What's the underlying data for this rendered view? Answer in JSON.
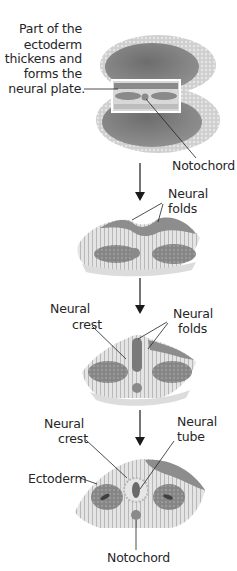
{
  "diagram": {
    "stages": [
      {
        "id": "embryo",
        "labels": {
          "neural_plate_line1": "Part of the",
          "neural_plate_line2": "ectoderm",
          "neural_plate_line3": "thickens and",
          "neural_plate_line4": "forms the",
          "neural_plate_line5": "neural plate.",
          "notochord": "Notochord"
        }
      },
      {
        "id": "neural-folds-stage",
        "labels": {
          "folds_line1": "Neural",
          "folds_line2": "folds"
        }
      },
      {
        "id": "neural-crest-stage",
        "labels": {
          "crest_line1": "Neural",
          "crest_line2": "crest",
          "folds_line1": "Neural",
          "folds_line2": "folds"
        }
      },
      {
        "id": "neural-tube-stage",
        "labels": {
          "crest_line1": "Neural",
          "crest_line2": "crest",
          "tube_line1": "Neural",
          "tube_line2": "tube",
          "ectoderm": "Ectoderm",
          "notochord": "Notochord"
        }
      }
    ],
    "colors": {
      "tissue_dark": "#7a7a7a",
      "tissue_mid": "#a8a8a8",
      "tissue_light": "#d9d9d9",
      "background": "#ffffff",
      "arrow": "#1a1a1a"
    }
  }
}
